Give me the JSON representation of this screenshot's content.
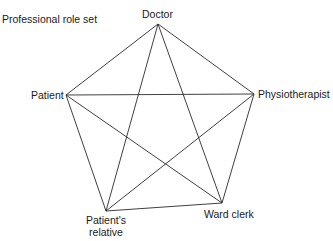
{
  "title": "Professional role set",
  "nodes": [
    {
      "id": "doctor",
      "label": "Doctor",
      "x": 158,
      "y": 24
    },
    {
      "id": "patient",
      "label": "Patient",
      "x": 66,
      "y": 95
    },
    {
      "id": "physiotherapist",
      "label": "Physiotherapist",
      "x": 254,
      "y": 94
    },
    {
      "id": "patients_relative",
      "label": "Patient's relative",
      "x": 106,
      "y": 211
    },
    {
      "id": "ward_clerk",
      "label": "Ward clerk",
      "x": 222,
      "y": 203
    }
  ],
  "edges": [
    [
      "doctor",
      "patient"
    ],
    [
      "doctor",
      "physiotherapist"
    ],
    [
      "doctor",
      "patients_relative"
    ],
    [
      "doctor",
      "ward_clerk"
    ],
    [
      "patient",
      "physiotherapist"
    ],
    [
      "patient",
      "patients_relative"
    ],
    [
      "patient",
      "ward_clerk"
    ],
    [
      "physiotherapist",
      "patients_relative"
    ],
    [
      "physiotherapist",
      "ward_clerk"
    ],
    [
      "patients_relative",
      "ward_clerk"
    ]
  ],
  "style": {
    "line_color": "#2a2a2a"
  }
}
